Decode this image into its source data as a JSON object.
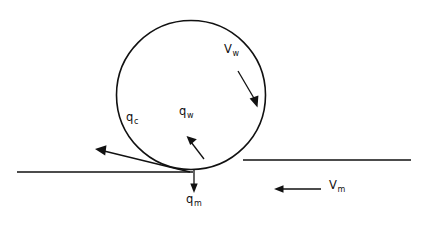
{
  "figure": {
    "background_color": "#ffffff",
    "stroke_color": "#111111",
    "width": 423,
    "height": 226
  },
  "shapes": {
    "droplet": {
      "name": "droplet-circle",
      "cx": 191,
      "cy": 95,
      "r": 74.5
    },
    "surface_left": {
      "name": "surface-line-left",
      "x1": 17,
      "y1": 172,
      "x2": 193,
      "y2": 172
    },
    "surface_right": {
      "name": "surface-line-right",
      "x1": 243,
      "y1": 160,
      "x2": 411,
      "y2": 160
    }
  },
  "arrows": [
    {
      "id": "vw",
      "name": "vapor-velocity-arrow",
      "label": "V",
      "subscript": "w",
      "x1": 238,
      "y1": 71,
      "x2": 257,
      "y2": 104,
      "label_x": 224,
      "label_y": 50
    },
    {
      "id": "qw",
      "name": "wall-heat-flux-arrow",
      "label": "q",
      "subscript": "w",
      "x1": 203,
      "y1": 158,
      "x2": 188,
      "y2": 138,
      "label_x": 179,
      "label_y": 110
    },
    {
      "id": "qc",
      "name": "conduction-heat-flux-arrow",
      "label": "q",
      "subscript": "c",
      "x1": 190,
      "y1": 172,
      "x2": 96,
      "y2": 149,
      "label_x": 127,
      "label_y": 116
    },
    {
      "id": "qm",
      "name": "mass-flux-arrow",
      "label": "q",
      "subscript": "m",
      "x1": 194,
      "y1": 170,
      "x2": 194,
      "y2": 192,
      "label_x": 186,
      "label_y": 197
    },
    {
      "id": "vm",
      "name": "mainstream-velocity-arrow",
      "label": "V",
      "subscript": "m",
      "x1": 321,
      "y1": 189,
      "x2": 275,
      "y2": 189,
      "label_x": 330,
      "label_y": 182
    }
  ]
}
